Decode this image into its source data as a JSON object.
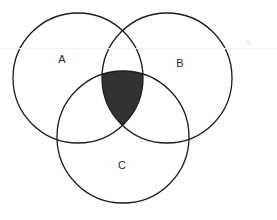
{
  "canvas": {
    "width": 277,
    "height": 220,
    "background": "#ffffff"
  },
  "style": {
    "stroke_color": "#1c1c1c",
    "stroke_width": 1.3,
    "shaded_fill": "#333333",
    "label_color": "#2b2b2b",
    "label_font_size": 11
  },
  "diagram": {
    "type": "venn-3-set",
    "title": "",
    "shaded_region": "A-intersect-B-intersect-C",
    "shaded_fill": "#333333",
    "circles": [
      {
        "id": "A",
        "label": "A",
        "cx": 78,
        "cy": 78,
        "r": 65,
        "label_x": 62,
        "label_y": 60
      },
      {
        "id": "B",
        "label": "B",
        "cx": 167,
        "cy": 78,
        "r": 65,
        "label_x": 180,
        "label_y": 64
      },
      {
        "id": "C",
        "label": "C",
        "cx": 123,
        "cy": 137,
        "r": 66,
        "label_x": 122,
        "label_y": 166
      }
    ]
  },
  "artifacts": {
    "scanline_y": 48,
    "speck": {
      "x": 246,
      "y": 40
    }
  }
}
